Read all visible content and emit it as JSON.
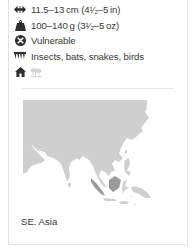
{
  "facts": [
    {
      "icon": "length-arrows-icon",
      "text": "11.5–13 cm (4½–5 in)"
    },
    {
      "icon": "weight-icon",
      "text": "100–140 g (3½–5 oz)"
    },
    {
      "icon": "status-x-circle-icon",
      "text": "Vulnerable"
    },
    {
      "icon": "diet-teeth-icon",
      "text": "Insects, bats, snakes, birds"
    }
  ],
  "display": {
    "length": "11.5–13 cm (4¹⁄₂–5 in)",
    "weight": "100–140 g (3¹⁄₂–5 oz)",
    "status": "Vulnerable",
    "diet": "Insects, bats, snakes, birds"
  },
  "habitat": {
    "icons": [
      {
        "name": "house-icon",
        "active": true
      },
      {
        "name": "forest-icon",
        "active": false
      }
    ]
  },
  "map": {
    "region_label": "SE. Asia",
    "land_color": "#cfcfcf",
    "highlight_color": "#9a9a9a"
  },
  "colors": {
    "text": "#3a3a3a",
    "icon": "#2e2e2e",
    "icon_faded": "#d4d4d4",
    "border": "#e2e2e2"
  }
}
